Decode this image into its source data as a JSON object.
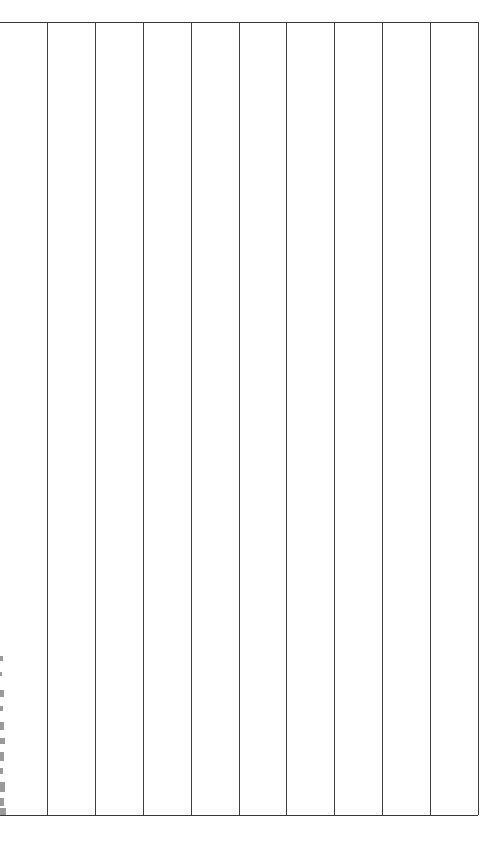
{
  "document": {
    "type": "table-grid",
    "background_color": "#ffffff",
    "page_width": 499,
    "page_height": 847,
    "description": "Empty bordered table grid with ten vertical column rules and a top and bottom horizontal rule; all cells blank.",
    "title": "",
    "caption": ""
  },
  "table": {
    "name": "empty-table",
    "left": 0,
    "top": 22,
    "right": 478,
    "bottom": 815,
    "width": 478,
    "height": 793,
    "line_color": "#383838",
    "line_width_px": 1.4,
    "row_count": 1,
    "column_count": 10,
    "header_row": null,
    "column_headers": [
      "",
      "",
      "",
      "",
      "",
      "",
      "",
      "",
      "",
      ""
    ],
    "rows": [
      {
        "name": "table-row",
        "cells": [
          "",
          "",
          "",
          "",
          "",
          "",
          "",
          "",
          "",
          ""
        ]
      }
    ],
    "horizontal_rules": [
      {
        "name": "table-top-rule",
        "y": 22
      },
      {
        "name": "table-bottom-rule",
        "y": 815
      }
    ],
    "vertical_rules": [
      {
        "name": "column-rule-1",
        "x": 47
      },
      {
        "name": "column-rule-2",
        "x": 95
      },
      {
        "name": "column-rule-3",
        "x": 143
      },
      {
        "name": "column-rule-4",
        "x": 191
      },
      {
        "name": "column-rule-5",
        "x": 239
      },
      {
        "name": "column-rule-6",
        "x": 286
      },
      {
        "name": "column-rule-7",
        "x": 334
      },
      {
        "name": "column-rule-8",
        "x": 382
      },
      {
        "name": "column-rule-9",
        "x": 430
      },
      {
        "name": "column-rule-10",
        "x": 478
      }
    ]
  },
  "left_edge_fragments": {
    "name": "clipped-text-fragments",
    "color": "#9a9a9a",
    "note": "Partial glyph marks cut off at the left page boundary.",
    "marks": [
      {
        "top": 656,
        "height": 5,
        "width": 3
      },
      {
        "top": 672,
        "height": 4,
        "width": 2
      },
      {
        "top": 690,
        "height": 7,
        "width": 4
      },
      {
        "top": 706,
        "height": 5,
        "width": 3
      },
      {
        "top": 722,
        "height": 8,
        "width": 4
      },
      {
        "top": 738,
        "height": 6,
        "width": 5
      },
      {
        "top": 752,
        "height": 9,
        "width": 4
      },
      {
        "top": 768,
        "height": 6,
        "width": 3
      },
      {
        "top": 782,
        "height": 10,
        "width": 5
      },
      {
        "top": 798,
        "height": 8,
        "width": 4
      },
      {
        "top": 808,
        "height": 7,
        "width": 6
      }
    ]
  }
}
